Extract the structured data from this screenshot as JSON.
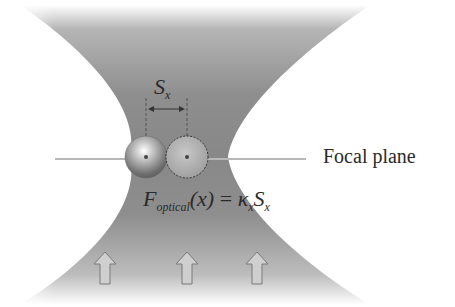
{
  "diagram": {
    "labels": {
      "focal_plane": "Focal plane",
      "displacement": {
        "main": "S",
        "sub": "x"
      },
      "equation": {
        "F": "F",
        "F_sub": "optical",
        "arg": "(x)",
        "equals": " = ",
        "kappa": "κ",
        "kappa_sub": "x",
        "S": "S",
        "S_sub": "x"
      }
    },
    "elements": {
      "beam": "focused laser beam (hourglass shape)",
      "bead_displaced": "trapped bead (displaced position)",
      "bead_equilibrium": "bead at trap center (dashed outline)",
      "arrows": [
        "up-arrow",
        "up-arrow",
        "up-arrow"
      ]
    },
    "colors": {
      "beam": "#8a8a8a",
      "focal_line": "#b8b8b8",
      "text": "#2a2a2a",
      "arrow_fill": "#cfcfcf",
      "arrow_stroke": "#7a7a7a"
    }
  }
}
